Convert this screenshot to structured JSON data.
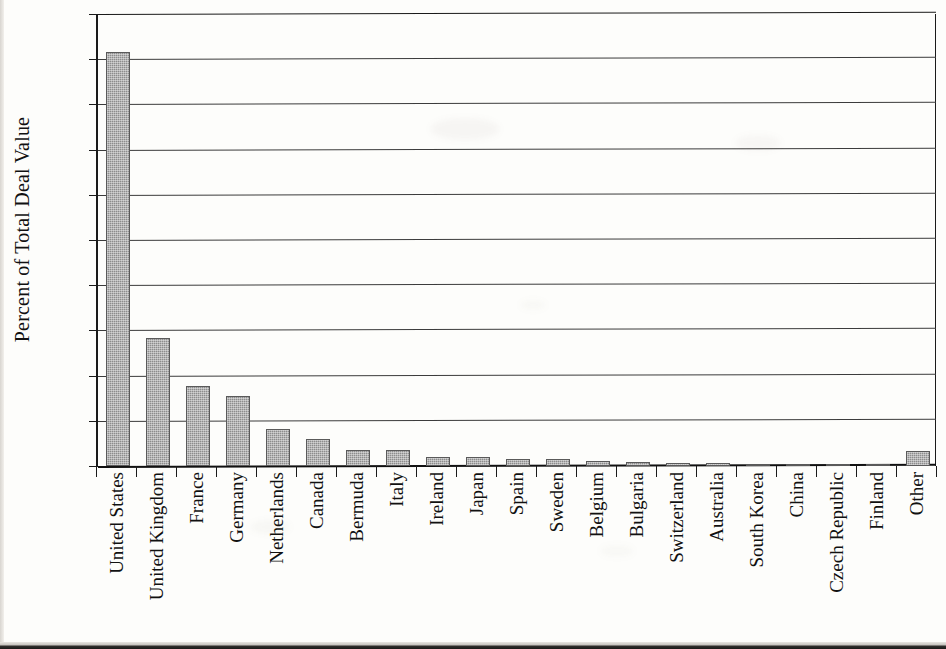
{
  "chart_data": {
    "type": "bar",
    "title": "",
    "subtitle": "",
    "xlabel": "",
    "ylabel": "Percent of Total Deal Value",
    "ylim": [
      0,
      50
    ],
    "ytick_values": [
      0,
      5,
      10,
      15,
      20,
      25,
      30,
      35,
      40,
      45,
      50
    ],
    "ytick_labels": [
      "0%",
      "5%",
      "10%",
      "15%",
      "20%",
      "25%",
      "30%",
      "35%",
      "40%",
      "45%",
      "50%"
    ],
    "grid": true,
    "legend": null,
    "legend_position": "none",
    "bar_color": "#8d8d8d",
    "categories": [
      "United States",
      "United Kingdom",
      "France",
      "Germany",
      "Netherlands",
      "Canada",
      "Bermuda",
      "Italy",
      "Ireland",
      "Japan",
      "Spain",
      "Sweden",
      "Belgium",
      "Bulgaria",
      "Switzerland",
      "Australia",
      "South Korea",
      "China",
      "Czech Republic",
      "Finland",
      "Other"
    ],
    "values": [
      45.8,
      14.2,
      8.9,
      7.7,
      4.1,
      3.0,
      1.8,
      1.8,
      1.0,
      1.0,
      0.8,
      0.8,
      0.6,
      0.4,
      0.35,
      0.3,
      0.25,
      0.2,
      0.2,
      0.15,
      1.7
    ],
    "units": "percent"
  }
}
